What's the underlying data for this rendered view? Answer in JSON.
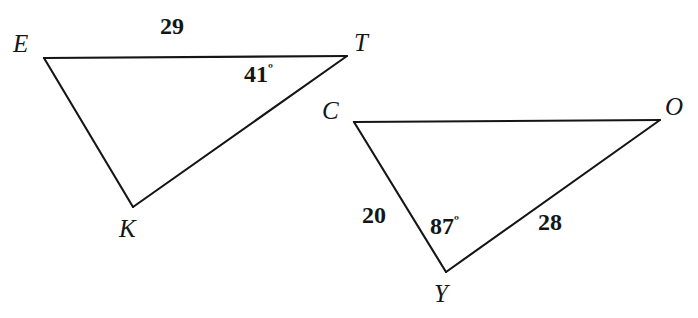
{
  "figure": {
    "type": "geometry-diagram",
    "background_color": "#ffffff",
    "stroke_color": "#151515",
    "text_color": "#151515",
    "stroke_width": 2.1,
    "canvas": {
      "width": 698,
      "height": 318
    }
  },
  "triangles": [
    {
      "name": "triangle-ekt",
      "vertices": [
        {
          "label": "E",
          "x": 44,
          "y": 58,
          "label_x": 13,
          "label_y": 31
        },
        {
          "label": "T",
          "x": 347,
          "y": 56,
          "label_x": 354,
          "label_y": 30
        },
        {
          "label": "K",
          "x": 133,
          "y": 207,
          "label_x": 119,
          "label_y": 216
        }
      ],
      "sides": [
        {
          "from": "E",
          "to": "T",
          "length": "29",
          "label_x": 160,
          "label_y": 14
        },
        {
          "from": "T",
          "to": "K",
          "length": "",
          "label_x": 0,
          "label_y": 0
        },
        {
          "from": "K",
          "to": "E",
          "length": "",
          "label_x": 0,
          "label_y": 0
        }
      ],
      "angles": [
        {
          "at": "T",
          "value": "41",
          "unit": "º",
          "label_x": 244,
          "label_y": 62
        }
      ]
    },
    {
      "name": "triangle-coy",
      "vertices": [
        {
          "label": "C",
          "x": 354,
          "y": 122,
          "label_x": 322,
          "label_y": 98
        },
        {
          "label": "O",
          "x": 660,
          "y": 120,
          "label_x": 665,
          "label_y": 94
        },
        {
          "label": "Y",
          "x": 446,
          "y": 272,
          "label_x": 434,
          "label_y": 281
        }
      ],
      "sides": [
        {
          "from": "C",
          "to": "Y",
          "length": "20",
          "label_x": 362,
          "label_y": 203
        },
        {
          "from": "Y",
          "to": "O",
          "length": "28",
          "label_x": 538,
          "label_y": 210
        },
        {
          "from": "O",
          "to": "C",
          "length": "",
          "label_x": 0,
          "label_y": 0
        }
      ],
      "angles": [
        {
          "at": "Y",
          "value": "87",
          "unit": "º",
          "label_x": 430,
          "label_y": 214
        }
      ]
    }
  ],
  "labels": {
    "vertex_E": "E",
    "vertex_T": "T",
    "vertex_K": "K",
    "vertex_C": "C",
    "vertex_O": "O",
    "vertex_Y": "Y",
    "side_ET": "29",
    "side_CY": "20",
    "side_YO": "28",
    "angle_T": "41",
    "angle_Y": "87",
    "degree_symbol": "º"
  }
}
